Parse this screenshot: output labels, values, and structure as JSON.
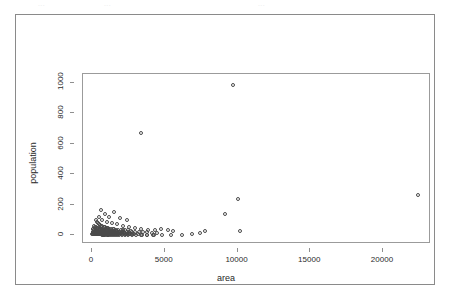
{
  "figure": {
    "ghost_text_top": [
      "...",
      "...",
      "..."
    ]
  },
  "chart_data": {
    "type": "scatter",
    "title": "",
    "xlabel": "area",
    "ylabel": "population",
    "xlim": [
      -620,
      23300
    ],
    "ylim": [
      -60,
      1060
    ],
    "xticks": [
      0,
      5000,
      10000,
      15000,
      20000
    ],
    "xtick_labels": [
      "0",
      "5000",
      "10000",
      "15000",
      "20000"
    ],
    "yticks": [
      0,
      200,
      400,
      600,
      800,
      1000
    ],
    "ytick_labels": [
      "0",
      "200",
      "400",
      "600",
      "800",
      "1000"
    ],
    "grid": false,
    "legend": null,
    "marker": "open-circle",
    "marker_color": "#4a4a4a",
    "points": [
      [
        3350,
        670
      ],
      [
        9700,
        985
      ],
      [
        10050,
        235
      ],
      [
        9150,
        135
      ],
      [
        7800,
        25
      ],
      [
        10150,
        25
      ],
      [
        22400,
        260
      ],
      [
        1500,
        150
      ],
      [
        1950,
        110
      ],
      [
        2400,
        95
      ],
      [
        1150,
        120
      ],
      [
        900,
        140
      ],
      [
        600,
        165
      ],
      [
        460,
        120
      ],
      [
        700,
        100
      ],
      [
        1050,
        88
      ],
      [
        1350,
        80
      ],
      [
        1700,
        72
      ],
      [
        2100,
        60
      ],
      [
        2550,
        50
      ],
      [
        2950,
        44
      ],
      [
        3400,
        38
      ],
      [
        3850,
        34
      ],
      [
        4300,
        30
      ],
      [
        4750,
        38
      ],
      [
        5200,
        30
      ],
      [
        5600,
        26
      ],
      [
        240,
        95
      ],
      [
        320,
        82
      ],
      [
        400,
        76
      ],
      [
        500,
        70
      ],
      [
        560,
        64
      ],
      [
        640,
        60
      ],
      [
        720,
        56
      ],
      [
        800,
        52
      ],
      [
        880,
        50
      ],
      [
        960,
        48
      ],
      [
        1040,
        46
      ],
      [
        1120,
        44
      ],
      [
        1200,
        42
      ],
      [
        1300,
        40
      ],
      [
        1420,
        38
      ],
      [
        1540,
        36
      ],
      [
        1680,
        34
      ],
      [
        1820,
        33
      ],
      [
        1960,
        32
      ],
      [
        2120,
        31
      ],
      [
        2300,
        30
      ],
      [
        2500,
        29
      ],
      [
        2700,
        28
      ],
      [
        150,
        58
      ],
      [
        200,
        54
      ],
      [
        260,
        50
      ],
      [
        310,
        48
      ],
      [
        360,
        46
      ],
      [
        410,
        44
      ],
      [
        460,
        42
      ],
      [
        520,
        40
      ],
      [
        580,
        38
      ],
      [
        640,
        37
      ],
      [
        700,
        36
      ],
      [
        760,
        35
      ],
      [
        820,
        34
      ],
      [
        880,
        33
      ],
      [
        950,
        32
      ],
      [
        1020,
        31
      ],
      [
        1100,
        30
      ],
      [
        1180,
        29
      ],
      [
        1260,
        28
      ],
      [
        1340,
        27
      ],
      [
        1430,
        26
      ],
      [
        1520,
        25
      ],
      [
        1620,
        24
      ],
      [
        1720,
        23
      ],
      [
        1830,
        22
      ],
      [
        1950,
        21
      ],
      [
        2080,
        20
      ],
      [
        2220,
        20
      ],
      [
        2380,
        19
      ],
      [
        2560,
        18
      ],
      [
        2760,
        18
      ],
      [
        2980,
        17
      ],
      [
        3220,
        17
      ],
      [
        3500,
        16
      ],
      [
        3800,
        16
      ],
      [
        4150,
        15
      ],
      [
        4500,
        15
      ],
      [
        60,
        40
      ],
      [
        90,
        36
      ],
      [
        120,
        33
      ],
      [
        150,
        30
      ],
      [
        180,
        28
      ],
      [
        210,
        26
      ],
      [
        240,
        25
      ],
      [
        280,
        24
      ],
      [
        320,
        23
      ],
      [
        360,
        22
      ],
      [
        400,
        21
      ],
      [
        440,
        20
      ],
      [
        480,
        19
      ],
      [
        530,
        19
      ],
      [
        580,
        18
      ],
      [
        630,
        18
      ],
      [
        680,
        17
      ],
      [
        730,
        17
      ],
      [
        790,
        16
      ],
      [
        850,
        16
      ],
      [
        910,
        15
      ],
      [
        980,
        15
      ],
      [
        1050,
        14
      ],
      [
        1120,
        14
      ],
      [
        1200,
        13
      ],
      [
        1280,
        13
      ],
      [
        1370,
        12
      ],
      [
        1460,
        12
      ],
      [
        1560,
        11
      ],
      [
        1660,
        11
      ],
      [
        1780,
        11
      ],
      [
        1900,
        10
      ],
      [
        2030,
        10
      ],
      [
        2180,
        10
      ],
      [
        2340,
        9
      ],
      [
        2520,
        9
      ],
      [
        2720,
        9
      ],
      [
        40,
        22
      ],
      [
        70,
        20
      ],
      [
        100,
        18
      ],
      [
        130,
        16
      ],
      [
        160,
        15
      ],
      [
        190,
        14
      ],
      [
        220,
        13
      ],
      [
        250,
        12
      ],
      [
        290,
        12
      ],
      [
        330,
        11
      ],
      [
        370,
        11
      ],
      [
        410,
        10
      ],
      [
        450,
        10
      ],
      [
        500,
        9
      ],
      [
        550,
        9
      ],
      [
        600,
        8
      ],
      [
        660,
        8
      ],
      [
        720,
        8
      ],
      [
        780,
        7
      ],
      [
        840,
        7
      ],
      [
        910,
        7
      ],
      [
        980,
        6
      ],
      [
        1060,
        6
      ],
      [
        1140,
        6
      ],
      [
        1230,
        5
      ],
      [
        1320,
        5
      ],
      [
        1420,
        5
      ],
      [
        1530,
        5
      ],
      [
        1650,
        4
      ],
      [
        1780,
        4
      ],
      [
        1920,
        4
      ],
      [
        2070,
        4
      ],
      [
        2240,
        3
      ],
      [
        2430,
        3
      ],
      [
        2640,
        3
      ],
      [
        2880,
        3
      ],
      [
        3150,
        3
      ],
      [
        3450,
        2
      ],
      [
        3800,
        2
      ],
      [
        4200,
        2
      ],
      [
        30,
        8
      ],
      [
        60,
        7
      ],
      [
        95,
        6
      ],
      [
        135,
        6
      ],
      [
        175,
        5
      ],
      [
        215,
        5
      ],
      [
        260,
        5
      ],
      [
        305,
        4
      ],
      [
        350,
        4
      ],
      [
        400,
        4
      ],
      [
        455,
        3
      ],
      [
        510,
        3
      ],
      [
        570,
        3
      ],
      [
        635,
        3
      ],
      [
        700,
        2
      ],
      [
        770,
        2
      ],
      [
        845,
        2
      ],
      [
        925,
        2
      ],
      [
        1010,
        2
      ],
      [
        1100,
        2
      ],
      [
        1200,
        1
      ],
      [
        1310,
        1
      ],
      [
        1430,
        1
      ],
      [
        1560,
        1
      ],
      [
        1700,
        1
      ],
      [
        1860,
        1
      ],
      [
        2040,
        1
      ],
      [
        2240,
        1
      ],
      [
        2470,
        1
      ],
      [
        2730,
        1
      ],
      [
        3030,
        1
      ],
      [
        3380,
        1
      ],
      [
        3780,
        1
      ],
      [
        4250,
        1
      ],
      [
        4800,
        1
      ],
      [
        5450,
        1
      ],
      [
        6200,
        2
      ],
      [
        6900,
        8
      ],
      [
        7400,
        14
      ]
    ]
  }
}
